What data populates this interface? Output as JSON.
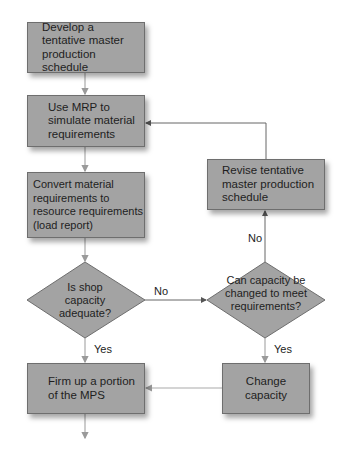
{
  "flowchart": {
    "nodes": {
      "develop": {
        "type": "process",
        "text": "Develop a tentative master production schedule"
      },
      "use_mrp": {
        "type": "process",
        "text": "Use MRP to simulate material requirements"
      },
      "convert": {
        "type": "process",
        "text": "Convert material requirements to resource requirements (load report)"
      },
      "shop_capacity": {
        "type": "decision",
        "text": "Is shop capacity adequate?"
      },
      "can_change": {
        "type": "decision",
        "text": "Can capacity be changed to meet requirements?"
      },
      "revise": {
        "type": "process",
        "text": "Revise tentative master production schedule"
      },
      "firm_up": {
        "type": "process",
        "text": "Firm up a portion of the MPS"
      },
      "change_capacity": {
        "type": "process",
        "text": "Change capacity"
      }
    },
    "edges": [
      {
        "from": "develop",
        "to": "use_mrp",
        "label": ""
      },
      {
        "from": "use_mrp",
        "to": "convert",
        "label": ""
      },
      {
        "from": "convert",
        "to": "shop_capacity",
        "label": ""
      },
      {
        "from": "shop_capacity",
        "to": "can_change",
        "label": "No"
      },
      {
        "from": "shop_capacity",
        "to": "firm_up",
        "label": "Yes"
      },
      {
        "from": "can_change",
        "to": "revise",
        "label": "No"
      },
      {
        "from": "can_change",
        "to": "change_capacity",
        "label": "Yes"
      },
      {
        "from": "revise",
        "to": "use_mrp",
        "label": ""
      },
      {
        "from": "change_capacity",
        "to": "firm_up",
        "label": ""
      },
      {
        "from": "firm_up",
        "to": "next",
        "label": ""
      }
    ],
    "labels": {
      "no1": "No",
      "no2": "No",
      "yes1": "Yes",
      "yes2": "Yes"
    },
    "colors": {
      "box_fill": "#a3a3a3",
      "box_border": "#6e6e6e",
      "line": "#7a7a7a",
      "line_light": "#aaaaaa"
    }
  }
}
